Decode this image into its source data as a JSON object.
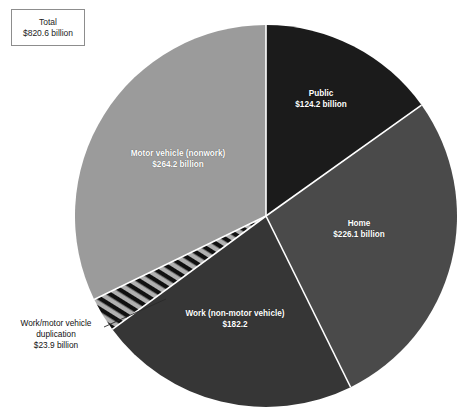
{
  "chart_data": {
    "type": "pie",
    "title": "",
    "total_label": "Total",
    "total_value_label": "$820.6 billion",
    "total_value": 820.6,
    "units": "billion USD",
    "legend": "none",
    "grid": false,
    "categories": [
      "Public",
      "Home",
      "Work (non-motor vehicle)",
      "Work/motor vehicle duplication",
      "Motor vehicle (nonwork)"
    ],
    "values": [
      124.2,
      226.1,
      182.2,
      23.9,
      264.2
    ],
    "slices": [
      {
        "name": "Public",
        "value": 124.2,
        "value_label": "$124.2 billion",
        "percent": 15.1,
        "start_angle": 0,
        "sweep": 54.5,
        "color": "#1b1b1b",
        "pattern": "solid",
        "label_color": "#ffffff"
      },
      {
        "name": "Home",
        "value": 226.1,
        "value_label": "$226.1 billion",
        "percent": 27.6,
        "start_angle": 54.5,
        "sweep": 99.2,
        "color": "#4a4a4a",
        "pattern": "solid",
        "label_color": "#ffffff"
      },
      {
        "name": "Work (non-motor vehicle)",
        "value": 182.2,
        "value_label": "$182.2",
        "percent": 22.2,
        "start_angle": 153.7,
        "sweep": 79.9,
        "color": "#363636",
        "pattern": "solid",
        "label_color": "#ffffff"
      },
      {
        "name": "Work/motor vehicle duplication",
        "value": 23.9,
        "value_label": "$23.9 billion",
        "percent": 2.9,
        "start_angle": 233.6,
        "sweep": 10.5,
        "color": "#101010",
        "pattern": "diagonal-hatch",
        "label_color": "#111111"
      },
      {
        "name": "Motor vehicle (nonwork)",
        "value": 264.2,
        "value_label": "$264.2 billion",
        "percent": 32.2,
        "start_angle": 244.1,
        "sweep": 115.9,
        "color": "#9b9b9b",
        "pattern": "solid",
        "label_color": "#ffffff"
      }
    ],
    "geometry": {
      "center_x": 266,
      "center_y": 216,
      "radius": 191,
      "separator_color": "#ffffff",
      "separator_width": 1.6
    },
    "colors": {
      "background": "#ffffff",
      "public": "#1b1b1b",
      "home": "#4a4a4a",
      "work": "#363636",
      "duplication_dark": "#101010",
      "duplication_light": "#b0b0b0",
      "motor_vehicle": "#9b9b9b",
      "box_border": "#8d8d8d",
      "text_dark": "#111111",
      "text_light": "#ffffff"
    }
  },
  "total_box": {
    "line1": "Total",
    "line2": "$820.6 billion"
  },
  "labels": {
    "public": {
      "name": "Public",
      "value": "$124.2 billion"
    },
    "home": {
      "name": "Home",
      "value": "$226.1 billion"
    },
    "work": {
      "name": "Work (non-motor vehicle)",
      "value": "$182.2"
    },
    "motor_vehicle": {
      "name": "Motor vehicle (nonwork)",
      "value": "$264.2 billion"
    },
    "duplication": {
      "line1": "Work/motor vehicle",
      "line2": "duplication",
      "line3": "$23.9 billion"
    }
  }
}
